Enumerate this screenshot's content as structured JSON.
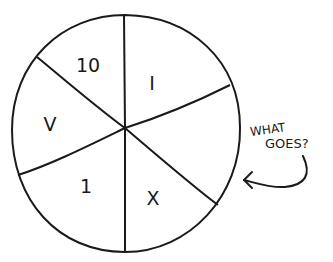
{
  "diagram": {
    "type": "spinner-wheel",
    "sectors": [
      {
        "label": "10",
        "position": "top-left"
      },
      {
        "label": "I",
        "position": "top-right"
      },
      {
        "label": "",
        "position": "right"
      },
      {
        "label": "X",
        "position": "bottom-right"
      },
      {
        "label": "1",
        "position": "bottom-left"
      },
      {
        "label": "V",
        "position": "left"
      }
    ],
    "annotation": {
      "line1": "WHAT",
      "line2": "GOES?",
      "arrow_target": "right sector (empty)"
    },
    "colors": {
      "ink": "#1a1a1a",
      "background": "#ffffff"
    }
  }
}
